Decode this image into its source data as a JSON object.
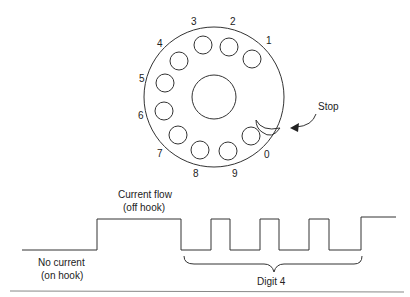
{
  "dial": {
    "digits": [
      "1",
      "2",
      "3",
      "4",
      "5",
      "6",
      "7",
      "8",
      "9",
      "0"
    ],
    "stop_label": "Stop"
  },
  "waveform": {
    "off_hook_label_1": "Current flow",
    "off_hook_label_2": "(off hook)",
    "on_hook_label_1": "No current",
    "on_hook_label_2": "(on hook)",
    "digit_label": "Digit 4"
  },
  "colors": {
    "line": "#333333",
    "text": "#222222"
  }
}
